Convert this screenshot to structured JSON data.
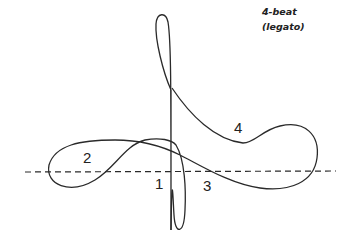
{
  "diagram": {
    "title_line1": "4-beat",
    "title_line2": "(legato)",
    "beats": [
      {
        "label": "1",
        "x": 157,
        "y": 178
      },
      {
        "label": "2",
        "x": 83,
        "y": 149
      },
      {
        "label": "3",
        "x": 204,
        "y": 178
      },
      {
        "label": "4",
        "x": 235,
        "y": 116
      }
    ],
    "colors": {
      "stroke": "#2a2a2a",
      "background": "#ffffff"
    }
  }
}
